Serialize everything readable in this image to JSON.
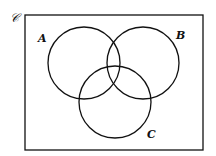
{
  "diagram": {
    "type": "venn",
    "universe": {
      "label": "𝒞",
      "rect": {
        "x": 25,
        "y": 15,
        "width": 178,
        "height": 135
      }
    },
    "sets": [
      {
        "label": "A",
        "cx": 84,
        "cy": 63,
        "r": 36,
        "label_x": 38,
        "label_y": 42
      },
      {
        "label": "B",
        "cx": 143,
        "cy": 63,
        "r": 36,
        "label_x": 176,
        "label_y": 39
      },
      {
        "label": "C",
        "cx": 115,
        "cy": 102,
        "r": 36,
        "label_x": 147,
        "label_y": 138
      }
    ],
    "stroke_color": "#111111",
    "background_color": "#ffffff"
  }
}
